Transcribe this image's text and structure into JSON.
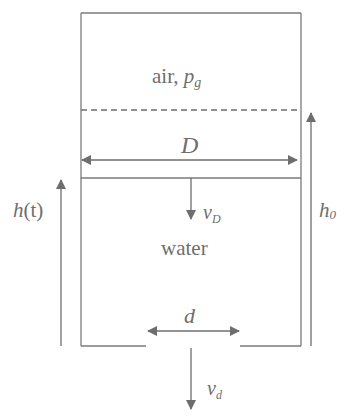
{
  "diagram": {
    "type": "tank-drain-schematic",
    "colors": {
      "line": "#7a7a7a",
      "text": "#6e6e6e",
      "background": "#ffffff"
    },
    "labels": {
      "air_text": "air, ",
      "air_symbol": "p",
      "air_symbol_sub": "g",
      "tank_diameter": "D",
      "surface_velocity": "v",
      "surface_velocity_sub": "D",
      "water": "water",
      "height_time": "h",
      "height_time_arg": "(t)",
      "initial_height": "h",
      "initial_height_sub": "0",
      "outlet_diameter": "d",
      "outlet_velocity": "v",
      "outlet_velocity_sub": "d"
    }
  }
}
